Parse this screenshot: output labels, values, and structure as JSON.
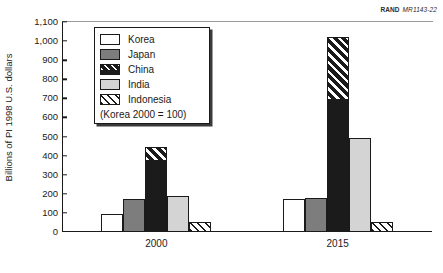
{
  "credit": {
    "org": "RAND",
    "code": "MR1143-22"
  },
  "legend": {
    "note": "(Korea 2000 = 100)",
    "items": [
      {
        "label": "Korea",
        "swatch": "swatch-korea-white",
        "color": "#ffffff"
      },
      {
        "label": "Japan",
        "swatch": "swatch-japan-darkgray",
        "color": "#7d7d7d"
      },
      {
        "label": "China",
        "swatch": "swatch-china-black-hatch",
        "color": "#1b1b1b"
      },
      {
        "label": "India",
        "swatch": "swatch-india-lightgray",
        "color": "#d4d4d4"
      },
      {
        "label": "Indonesia",
        "swatch": "swatch-indonesia-diagonal",
        "color": "#ffffff"
      }
    ]
  },
  "axis": {
    "y_title": "Billions of PI 1998 U.S. dollars",
    "y_ticks": [
      "0",
      "100",
      "200",
      "300",
      "400",
      "500",
      "600",
      "700",
      "800",
      "900",
      "1,000",
      "1,100"
    ],
    "x_ticks": [
      "2000",
      "2015"
    ]
  },
  "chart_data": {
    "type": "bar",
    "title": "",
    "subtitle": "",
    "xlabel": "",
    "ylabel": "Billions of PI 1998 U.S. dollars",
    "ylim": [
      0,
      1100
    ],
    "ytick_step": 100,
    "grid": false,
    "legend_position": "upper-left-inside",
    "annotations": [
      "(Korea 2000 = 100)",
      "RAND MR1143-22"
    ],
    "categories": [
      "2000",
      "2015"
    ],
    "series": [
      {
        "name": "Korea",
        "values": [
          95,
          172
        ]
      },
      {
        "name": "Japan",
        "values": [
          175,
          178
        ]
      },
      {
        "name": "China",
        "values": [
          445,
          1020
        ]
      },
      {
        "name": "India",
        "values": [
          190,
          495
        ]
      },
      {
        "name": "Indonesia",
        "values": [
          50,
          55
        ]
      }
    ],
    "china_hatch_breakpoints": [
      380,
      700
    ]
  }
}
